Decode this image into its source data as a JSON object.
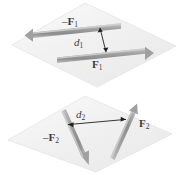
{
  "figure": {
    "background_color": "#ffffff"
  },
  "labels": {
    "neg_f1": {
      "minus": "–",
      "symbol": "F",
      "subscript": "1"
    },
    "d1": {
      "symbol": "d",
      "subscript": "1"
    },
    "f1": {
      "symbol": "F",
      "subscript": "1"
    },
    "d2": {
      "symbol": "d",
      "subscript": "2"
    },
    "f2": {
      "symbol": "F",
      "subscript": "2"
    },
    "neg_f2": {
      "minus": "–",
      "symbol": "F",
      "subscript": "2"
    }
  },
  "colors": {
    "plane_fill": "#f2f2f2",
    "plane_stroke": "#e0e0e0",
    "arrow_gray": "#9a9a9a",
    "arrow_gray_dark": "#7e7e7e",
    "arrow_gray_light": "#c3c3c3",
    "dim_line": "#1a1a1a",
    "text": "#3b3b3b"
  },
  "planes": [
    {
      "name": "upper-plane",
      "points": "85,3 176,46 97,87 12,45",
      "couple": "F1",
      "arrows": [
        {
          "name": "arrow-neg-f1",
          "label": "neg_f1",
          "from": [
            121,
            26
          ],
          "to": [
            27,
            36
          ],
          "direction": "left"
        },
        {
          "name": "arrow-f1",
          "label": "f1",
          "from": [
            57,
            60
          ],
          "to": [
            152,
            50
          ],
          "direction": "right"
        }
      ],
      "dimension": {
        "name": "d1",
        "from": [
          101,
          29
        ],
        "to": [
          107,
          55
        ],
        "label": "d1"
      }
    },
    {
      "name": "lower-plane",
      "points": "85,96 172,134 96,172 8,140",
      "couple": "F2",
      "arrows": [
        {
          "name": "arrow-f2",
          "label": "f2",
          "from": [
            111,
            158
          ],
          "to": [
            136,
            107
          ],
          "direction": "up-right"
        },
        {
          "name": "arrow-neg-f2",
          "label": "neg_f2",
          "from": [
            62,
            112
          ],
          "to": [
            87,
            163
          ],
          "direction": "down-right"
        }
      ],
      "dimension": {
        "name": "d2",
        "from": [
          68,
          125
        ],
        "to": [
          126,
          120
        ],
        "label": "d2"
      }
    }
  ]
}
